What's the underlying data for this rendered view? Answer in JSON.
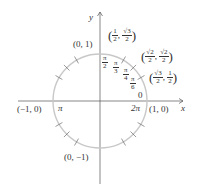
{
  "diagram": {
    "type": "unit-circle",
    "axes": {
      "x_label": "x",
      "y_label": "y"
    },
    "colors": {
      "circle": "#c8c8c8",
      "axis": "#555555",
      "text": "#333333"
    },
    "points": {
      "right": "(1, 0)",
      "top": "(0, 1)",
      "left": "(−1, 0)",
      "bottom": "(0, −1)",
      "p30": {
        "x_num": "√3",
        "x_den": "2",
        "y_num": "1",
        "y_den": "2"
      },
      "p45": {
        "x_num": "√2",
        "x_den": "2",
        "y_num": "√2",
        "y_den": "2"
      },
      "p60": {
        "x_num": "1",
        "x_den": "2",
        "y_num": "√3",
        "y_den": "2"
      }
    },
    "angles": {
      "zero": "0",
      "two_pi": "2π",
      "pi": "π",
      "pi_over_2": {
        "num": "π",
        "den": "2"
      },
      "pi_over_3": {
        "num": "π",
        "den": "3"
      },
      "pi_over_4": {
        "num": "π",
        "den": "4"
      },
      "pi_over_6": {
        "num": "π",
        "den": "6"
      }
    }
  }
}
